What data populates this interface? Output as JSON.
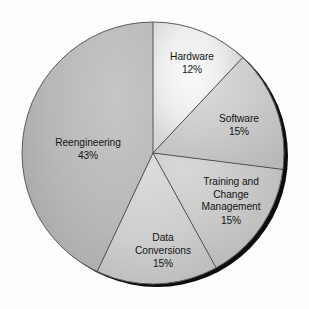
{
  "chart_data": {
    "type": "pie",
    "title": "",
    "subtitle": "",
    "xlabel": "",
    "ylabel": "",
    "legend_position": "none",
    "grid": false,
    "labels_on_slices": true,
    "start_angle_deg": 0,
    "direction": "clockwise",
    "total_percent": 100,
    "categories": [
      "Hardware",
      "Software",
      "Training and Change Management",
      "Data Conversions",
      "Reengineering"
    ],
    "values": [
      12,
      15,
      15,
      15,
      43
    ],
    "series": [
      {
        "name": "Share of cost",
        "values": [
          12,
          15,
          15,
          15,
          43
        ]
      }
    ],
    "slices": [
      {
        "name": "Hardware",
        "value": 12,
        "percent_label": "12%",
        "label_lines": [
          "Hardware"
        ],
        "start_deg": 0,
        "end_deg": 43.2,
        "fill": "#e9e9e9",
        "label_x": 192,
        "label_y": 57,
        "pct_x": 192,
        "pct_y": 70
      },
      {
        "name": "Software",
        "value": 15,
        "percent_label": "15%",
        "label_lines": [
          "Software"
        ],
        "start_deg": 43.2,
        "end_deg": 97.2,
        "fill": "#c9c9c9",
        "label_x": 239,
        "label_y": 119,
        "pct_x": 239,
        "pct_y": 132
      },
      {
        "name": "Training and Change Management",
        "value": 15,
        "percent_label": "15%",
        "label_lines": [
          "Training and",
          "Change",
          "Management"
        ],
        "start_deg": 97.2,
        "end_deg": 151.2,
        "fill": "#c4c4c4",
        "label_x": 231,
        "label_y": 182,
        "pct_x": 231,
        "pct_y": 221
      },
      {
        "name": "Data Conversions",
        "value": 15,
        "percent_label": "15%",
        "label_lines": [
          "Data",
          "Conversions"
        ],
        "start_deg": 151.2,
        "end_deg": 205.2,
        "fill": "#cfcfcf",
        "label_x": 163,
        "label_y": 238,
        "pct_x": 163,
        "pct_y": 264
      },
      {
        "name": "Reengineering",
        "value": 43,
        "percent_label": "43%",
        "label_lines": [
          "Reengineering"
        ],
        "start_deg": 205.2,
        "end_deg": 360,
        "fill": "#b6b6b6",
        "label_x": 88,
        "label_y": 143,
        "pct_x": 88,
        "pct_y": 156
      }
    ],
    "geometry": {
      "center_x": 153,
      "center_y": 153,
      "radius": 131,
      "shadow_offset_x": 4,
      "shadow_offset_y": 3
    },
    "colors": {
      "background": "#fdfdfd",
      "shadow": "#0d0d0d",
      "divider": "#4a4a4a",
      "outline": "#5a5a5a",
      "label_text": "#141414",
      "highlight": "#f4f4f4"
    }
  }
}
